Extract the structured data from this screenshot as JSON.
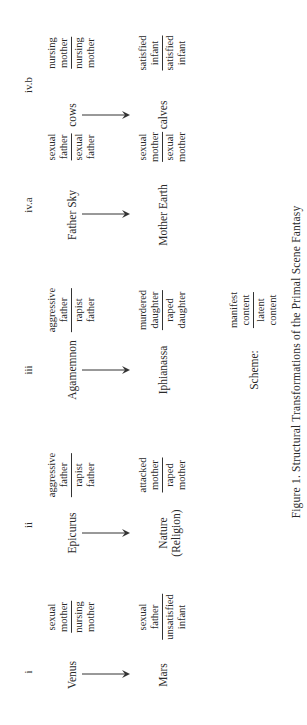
{
  "figure": {
    "caption": "Figure 1.  Structural Transformations of the Primal Scene Fantasy",
    "columns": [
      {
        "label": "i",
        "top_name": "Venus",
        "bottom_name": "Mars",
        "top_fraction": {
          "numerator": [
            "sexual",
            "mother"
          ],
          "denominator": [
            "nursing",
            "mother"
          ]
        },
        "bottom_fraction": {
          "numerator": [
            "sexual",
            "father"
          ],
          "denominator": [
            "unsatisfied",
            "infant"
          ]
        }
      },
      {
        "label": "ii",
        "top_name": "Epicurus",
        "bottom_name": "Nature",
        "bottom_name_2": "(Religion)",
        "top_fraction": {
          "numerator": [
            "aggressive",
            "father"
          ],
          "denominator": [
            "rapist",
            "father"
          ]
        },
        "bottom_fraction": {
          "numerator": [
            "attacked",
            "mother"
          ],
          "denominator": [
            "raped",
            "mother"
          ]
        }
      },
      {
        "label": "iii",
        "top_name": "Agamemnon",
        "bottom_name": "Iphianassa",
        "top_fraction": {
          "numerator": [
            "aggressive",
            "father"
          ],
          "denominator": [
            "rapist",
            "father"
          ]
        },
        "bottom_fraction": {
          "numerator": [
            "murdered",
            "daughter"
          ],
          "denominator": [
            "raped",
            "daughter"
          ]
        }
      },
      {
        "label": "iv.a",
        "top_name": "Father Sky",
        "bottom_name": "Mother Earth",
        "top_fraction": {
          "numerator": [
            "sexual",
            "father"
          ],
          "denominator": [
            "sexual",
            "father"
          ]
        },
        "bottom_fraction": {
          "numerator": [
            "sexual",
            "mother"
          ],
          "denominator": [
            "sexual",
            "mother"
          ]
        }
      },
      {
        "label": "iv.b",
        "top_name": "cows",
        "bottom_name": "calves",
        "top_fraction": {
          "numerator": [
            "nursing",
            "mother"
          ],
          "denominator": [
            "nursing",
            "mother"
          ]
        },
        "bottom_fraction": {
          "numerator": [
            "satisfied",
            "infant"
          ],
          "denominator": [
            "satisfied",
            "infant"
          ]
        }
      }
    ],
    "scheme": {
      "label": "Scheme:",
      "fraction": {
        "numerator": [
          "manifest",
          "content"
        ],
        "denominator": [
          "latent",
          "content"
        ]
      }
    },
    "colors": {
      "ink": "#2a2a2a",
      "background": "#ffffff"
    }
  }
}
